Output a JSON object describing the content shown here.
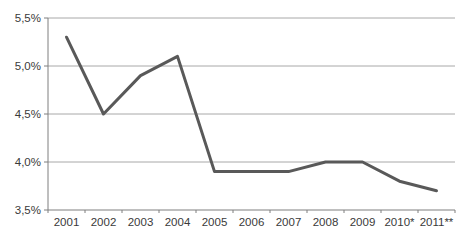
{
  "chart_data": {
    "type": "line",
    "title": "",
    "xlabel": "",
    "ylabel": "",
    "categories": [
      "2001",
      "2002",
      "2003",
      "2004",
      "2005",
      "2006",
      "2007",
      "2008",
      "2009",
      "2010*",
      "2011**"
    ],
    "values": [
      5.3,
      4.5,
      4.9,
      5.1,
      3.9,
      3.9,
      3.9,
      4.0,
      4.0,
      3.8,
      3.7
    ],
    "ylim": [
      3.5,
      5.5
    ],
    "y_ticks": [
      {
        "value": 5.5,
        "label": "5,5%"
      },
      {
        "value": 5.0,
        "label": "5,0%"
      },
      {
        "value": 4.5,
        "label": "4,5%"
      },
      {
        "value": 4.0,
        "label": "4,0%"
      },
      {
        "value": 3.5,
        "label": "3,5%"
      }
    ],
    "grid": true,
    "legend": "none",
    "colors": {
      "line": "#595959",
      "gridline": "#a8a8a8",
      "axis": "#7f7f7f",
      "tick_text": "#3a3a3a",
      "background": "#ffffff"
    }
  }
}
